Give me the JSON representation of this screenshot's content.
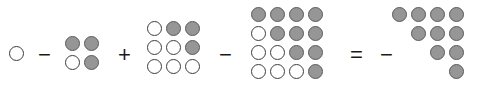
{
  "figure": {
    "kind": "dot-diagram-equation",
    "colors": {
      "filled_fill": "#969696",
      "filled_stroke": "#5a5a5a",
      "empty_fill": "#ffffff",
      "empty_stroke": "#3d3d3d",
      "background": "#ffffff",
      "operator": "#1a1a1a"
    },
    "dot_states": {
      "filled": "filled",
      "empty": "empty",
      "blank": "blank"
    },
    "terms": [
      {
        "id": "term-1",
        "name": "single-empty-dot",
        "x": 9,
        "y": 46,
        "cols": 1,
        "rows": 1,
        "grid": [
          [
            "empty"
          ]
        ]
      },
      {
        "id": "term-2",
        "name": "two-by-two-grid",
        "x": 65,
        "y": 36,
        "cols": 2,
        "rows": 2,
        "grid": [
          [
            "filled",
            "filled"
          ],
          [
            "empty",
            "filled"
          ]
        ]
      },
      {
        "id": "term-3",
        "name": "three-by-three-grid",
        "x": 147,
        "y": 21,
        "cols": 3,
        "rows": 3,
        "grid": [
          [
            "empty",
            "filled",
            "filled"
          ],
          [
            "empty",
            "empty",
            "filled"
          ],
          [
            "empty",
            "empty",
            "empty"
          ]
        ]
      },
      {
        "id": "term-4",
        "name": "four-by-four-grid",
        "x": 251,
        "y": 7,
        "cols": 4,
        "rows": 4,
        "grid": [
          [
            "filled",
            "filled",
            "filled",
            "filled"
          ],
          [
            "empty",
            "filled",
            "filled",
            "filled"
          ],
          [
            "empty",
            "empty",
            "filled",
            "filled"
          ],
          [
            "empty",
            "empty",
            "empty",
            "filled"
          ]
        ]
      },
      {
        "id": "term-5",
        "name": "staircase-grid",
        "x": 392,
        "y": 7,
        "cols": 4,
        "rows": 4,
        "grid": [
          [
            "filled",
            "filled",
            "filled",
            "filled"
          ],
          [
            "blank",
            "filled",
            "filled",
            "filled"
          ],
          [
            "blank",
            "blank",
            "filled",
            "filled"
          ],
          [
            "blank",
            "blank",
            "blank",
            "filled"
          ]
        ]
      }
    ],
    "operators": [
      {
        "id": "op-1",
        "name": "minus-sign-1",
        "symbol": "−",
        "x": 38,
        "y": 44
      },
      {
        "id": "op-2",
        "name": "plus-sign",
        "symbol": "+",
        "x": 118,
        "y": 44
      },
      {
        "id": "op-3",
        "name": "minus-sign-2",
        "symbol": "−",
        "x": 219,
        "y": 44
      },
      {
        "id": "op-4",
        "name": "equals-sign",
        "symbol": "=",
        "x": 350,
        "y": 44
      },
      {
        "id": "op-5",
        "name": "minus-sign-3",
        "symbol": "−",
        "x": 380,
        "y": 44
      }
    ]
  }
}
